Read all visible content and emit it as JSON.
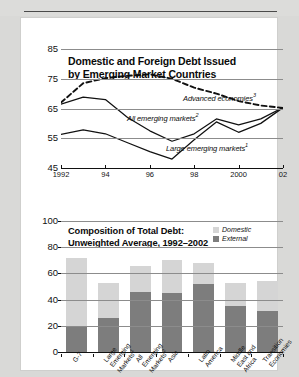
{
  "page": {
    "background_color": "#d9d9d7",
    "panel_color": "#ffffff",
    "faint_header_text": "",
    "rule_color": "#4a4a4a"
  },
  "chart_data": [
    {
      "id": "line-chart",
      "type": "line",
      "title": "Domestic and Foreign Debt Issued by Emerging Market Countries",
      "title_line1": "Domestic and Foreign Debt Issued",
      "title_line2": "by Emerging Market Countries",
      "xlabel": "",
      "ylabel": "",
      "ylim": [
        45,
        85
      ],
      "yticks": [
        45,
        55,
        65,
        75,
        85
      ],
      "xlim": [
        1992,
        2002
      ],
      "xticks": [
        1992,
        1994,
        1996,
        1998,
        2000,
        2002
      ],
      "xticklabels": [
        "1992",
        "94",
        "96",
        "98",
        "2000",
        "02"
      ],
      "grid": true,
      "legend": "inline-annotations",
      "x": [
        1992,
        1993,
        1994,
        1995,
        1996,
        1997,
        1998,
        1999,
        2000,
        2001,
        2002
      ],
      "series": [
        {
          "name": "Advanced economies",
          "footnote": "3",
          "style": "dashed",
          "color": "#111111",
          "annotation": "Advanced economies",
          "values": [
            67.0,
            73.5,
            75.2,
            76.0,
            76.5,
            75.0,
            72.0,
            70.0,
            67.5,
            66.0,
            65.2
          ]
        },
        {
          "name": "All emerging markets",
          "footnote": "2",
          "style": "solid",
          "color": "#111111",
          "annotation": "All emerging markets",
          "values": [
            66.5,
            68.8,
            68.0,
            62.0,
            57.5,
            54.0,
            56.5,
            61.5,
            59.5,
            61.5,
            65.3
          ]
        },
        {
          "name": "Large emerging markets",
          "footnote": "1",
          "style": "solid",
          "color": "#111111",
          "annotation": "Large emerging markets",
          "values": [
            56.3,
            57.8,
            56.5,
            53.5,
            50.5,
            48.0,
            54.5,
            60.5,
            57.0,
            60.0,
            65.3
          ]
        }
      ]
    },
    {
      "id": "bar-chart",
      "type": "bar",
      "subtype": "stacked",
      "title": "Composition of Total Debt: Unweighted Average, 1992–2002",
      "title_line1": "Composition of Total Debt:",
      "title_line2": "Unweighted Average, 1992–2002",
      "xlabel": "",
      "ylabel": "",
      "ylim": [
        0,
        100
      ],
      "yticks": [
        0,
        20,
        40,
        60,
        80,
        100
      ],
      "grid": true,
      "legend_position": "top-right",
      "categories": [
        "G-7",
        "Large Emerging Markets1",
        "All Emerging Markets2",
        "Asia",
        "Latin America",
        "Middle East and Africa",
        "Transition Economies"
      ],
      "category_lines": [
        [
          "G-7"
        ],
        [
          "Large",
          "Emerging",
          "Markets"
        ],
        [
          "All",
          "Emerging",
          "Markets"
        ],
        [
          "Asia"
        ],
        [
          "Latin",
          "America"
        ],
        [
          "Middle",
          "East and",
          "Africa"
        ],
        [
          "Transition",
          "Economies"
        ]
      ],
      "category_footnotes": [
        "",
        "1",
        "2",
        "",
        "",
        "",
        ""
      ],
      "series": [
        {
          "name": "External",
          "color": "#7d7d7d",
          "values": [
            19,
            26,
            46,
            45,
            52,
            35,
            31
          ]
        },
        {
          "name": "Domestic",
          "color": "#d5d5d5",
          "values": [
            53,
            27,
            20,
            25,
            16,
            18,
            23
          ]
        }
      ],
      "totals": [
        72,
        53,
        66,
        70,
        68,
        53,
        54
      ],
      "legend": [
        {
          "label": "Domestic",
          "color": "#d5d5d5"
        },
        {
          "label": "External",
          "color": "#7d7d7d"
        }
      ]
    }
  ]
}
